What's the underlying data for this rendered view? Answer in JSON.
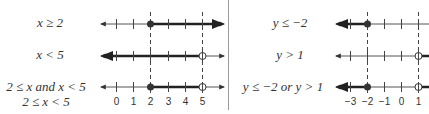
{
  "left_panel": {
    "rows": [
      {
        "label": "x ≥ 2"
      },
      {
        "label": "x < 5"
      },
      {
        "label": "2 ≤ x and x < 5",
        "sublabel": "2 ≤ x < 5"
      }
    ],
    "axis": {
      "ticks": [
        "0",
        "1",
        "2",
        "3",
        "4",
        "5"
      ],
      "guides": [
        "2",
        "5"
      ]
    }
  },
  "right_panel": {
    "rows": [
      {
        "label": "y ≤ −2"
      },
      {
        "label": "y > 1"
      },
      {
        "label": "y ≤ −2 or y > 1"
      }
    ],
    "axis": {
      "ticks": [
        "−3",
        "−2",
        "−1",
        "0",
        "1"
      ],
      "guides": [
        "−2",
        "1"
      ]
    }
  },
  "colors": {
    "line": "#444444",
    "bold": "#222222",
    "divider": "#9a9a9a"
  }
}
